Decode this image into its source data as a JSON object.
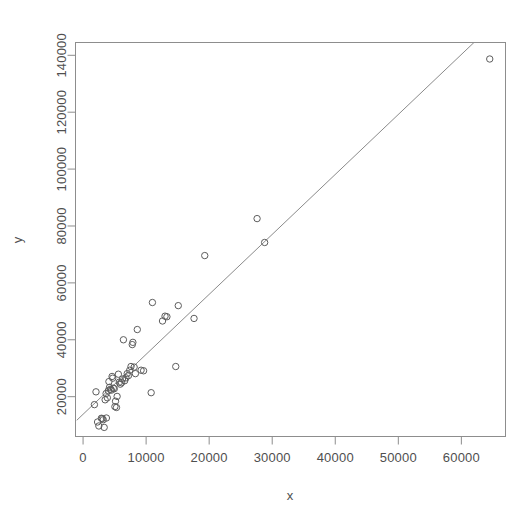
{
  "chart_data": {
    "type": "scatter",
    "title": "",
    "subtitle": "",
    "xlabel": "x",
    "ylabel": "y",
    "grid": false,
    "legend": null,
    "legend_position": "none",
    "xlim": [
      -1200,
      67000
    ],
    "ylim": [
      6000,
      144500
    ],
    "xticks": [
      0,
      10000,
      20000,
      30000,
      40000,
      50000,
      60000
    ],
    "yticks": [
      20000,
      40000,
      60000,
      80000,
      100000,
      120000,
      140000
    ],
    "xtick_labels": [
      "0",
      "10000",
      "20000",
      "30000",
      "40000",
      "50000",
      "60000"
    ],
    "ytick_labels": [
      "20000",
      "40000",
      "60000",
      "80000",
      "100000",
      "120000",
      "140000"
    ],
    "point_marker": "open-circle",
    "point_color": "#5d5d5d",
    "point_radius": 3.2,
    "frame_color": "#8d8d8d",
    "background_color": "#ffffff",
    "annotations": [],
    "series": [
      {
        "name": "observations",
        "marker": "open-circle",
        "points": [
          [
            1800,
            17200
          ],
          [
            2050,
            21700
          ],
          [
            2300,
            11100
          ],
          [
            2500,
            9700
          ],
          [
            2900,
            12400
          ],
          [
            3050,
            12300
          ],
          [
            3200,
            11900
          ],
          [
            3350,
            9200
          ],
          [
            3500,
            18900
          ],
          [
            3650,
            21100
          ],
          [
            3700,
            12500
          ],
          [
            3850,
            19600
          ],
          [
            4000,
            22100
          ],
          [
            4100,
            25300
          ],
          [
            4200,
            23300
          ],
          [
            4350,
            22600
          ],
          [
            4500,
            22300
          ],
          [
            4600,
            27100
          ],
          [
            4700,
            26500
          ],
          [
            4800,
            23000
          ],
          [
            4950,
            22800
          ],
          [
            5050,
            16500
          ],
          [
            5150,
            18400
          ],
          [
            5300,
            16200
          ],
          [
            5400,
            20100
          ],
          [
            5600,
            27900
          ],
          [
            5750,
            25100
          ],
          [
            5900,
            24400
          ],
          [
            6100,
            24900
          ],
          [
            6250,
            26200
          ],
          [
            6400,
            40000
          ],
          [
            6600,
            25600
          ],
          [
            6800,
            26600
          ],
          [
            7000,
            28100
          ],
          [
            7200,
            27400
          ],
          [
            7400,
            29300
          ],
          [
            7600,
            30600
          ],
          [
            7800,
            38300
          ],
          [
            7900,
            39100
          ],
          [
            8100,
            30400
          ],
          [
            8300,
            28100
          ],
          [
            8600,
            43600
          ],
          [
            9200,
            29300
          ],
          [
            9600,
            29100
          ],
          [
            10800,
            21400
          ],
          [
            11000,
            53100
          ],
          [
            12600,
            46600
          ],
          [
            13000,
            48300
          ],
          [
            13300,
            48100
          ],
          [
            14700,
            30600
          ],
          [
            15100,
            52000
          ],
          [
            17600,
            47500
          ],
          [
            19300,
            69600
          ],
          [
            27600,
            82600
          ],
          [
            28800,
            74200
          ],
          [
            64500,
            138700
          ]
        ]
      }
    ],
    "fit_line": {
      "name": "regression-line",
      "x_start": -1000,
      "y_start": 11700,
      "x_end": 62000,
      "y_end": 144500,
      "color": "#8a8a8a"
    }
  }
}
